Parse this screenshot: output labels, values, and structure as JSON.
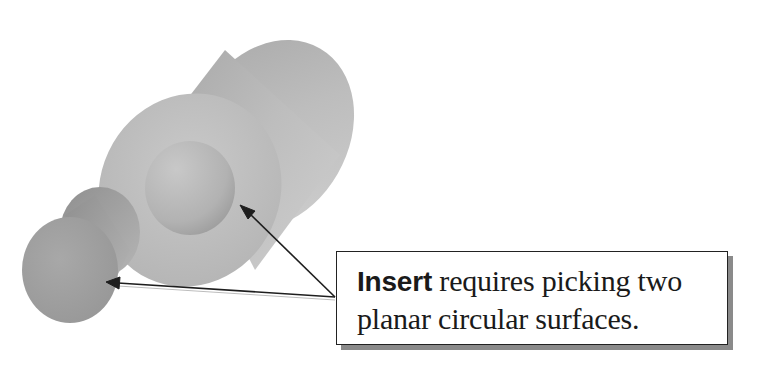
{
  "diagram": {
    "parts": [
      {
        "name": "large-cylinder",
        "label": "",
        "has_bore": true
      },
      {
        "name": "small-cylinder",
        "label": ""
      }
    ],
    "callout": {
      "keyword": "Insert",
      "line1_rest": " requires picking two",
      "line2": "planar circular surfaces."
    },
    "arrows": [
      {
        "from": "callout",
        "to": "large-cylinder-bore-face"
      },
      {
        "from": "callout",
        "to": "small-cylinder-end-face"
      }
    ],
    "colors": {
      "part_fill": "#b4b4b4",
      "part_shadow": "#8e8e8e",
      "arrow": "#1e1e1e",
      "box_shadow": "#8a8a8a"
    }
  }
}
